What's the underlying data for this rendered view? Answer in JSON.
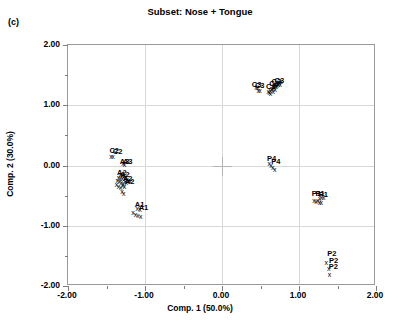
{
  "panel": {
    "label": "(c)"
  },
  "chart_data": {
    "type": "scatter",
    "title": "Subset: Nose + Tongue",
    "xlabel": "Comp. 1 (50.0%)",
    "ylabel": "Comp. 2 (30.0%)",
    "xlim": [
      -2.0,
      2.0
    ],
    "ylim": [
      -2.0,
      2.0
    ],
    "grid": true,
    "legend": "none",
    "marker_glyph": "x",
    "xticks": [
      {
        "value": -2.0,
        "label": "-2.00"
      },
      {
        "value": -1.0,
        "label": "-1.00"
      },
      {
        "value": 0.0,
        "label": "0.00"
      },
      {
        "value": 1.0,
        "label": "1.00"
      },
      {
        "value": 2.0,
        "label": "2.00"
      }
    ],
    "xticks_minor": [
      -1.5,
      -0.5,
      0.5,
      1.5
    ],
    "yticks": [
      {
        "value": 2.0,
        "label": "2.00"
      },
      {
        "value": 1.0,
        "label": "1.00"
      },
      {
        "value": 0.0,
        "label": "0.00"
      },
      {
        "value": -1.0,
        "label": "-1.00"
      },
      {
        "value": -2.0,
        "label": "-2.00"
      }
    ],
    "yticks_minor": [
      1.5,
      0.5,
      -0.5,
      -1.5
    ],
    "origin_marker": true,
    "groups": [
      {
        "name": "C3",
        "label_text": "C3",
        "points": [
          {
            "x": 0.44,
            "y": 1.3
          },
          {
            "x": 0.46,
            "y": 1.295
          },
          {
            "x": 0.47,
            "y": 1.26
          },
          {
            "x": 0.495,
            "y": 1.255
          },
          {
            "x": 0.6,
            "y": 1.23
          },
          {
            "x": 0.615,
            "y": 1.225
          },
          {
            "x": 0.625,
            "y": 1.255
          },
          {
            "x": 0.63,
            "y": 1.2
          },
          {
            "x": 0.645,
            "y": 1.265
          },
          {
            "x": 0.655,
            "y": 1.285
          },
          {
            "x": 0.66,
            "y": 1.32
          },
          {
            "x": 0.665,
            "y": 1.235
          },
          {
            "x": 0.675,
            "y": 1.3
          },
          {
            "x": 0.685,
            "y": 1.34
          },
          {
            "x": 0.69,
            "y": 1.275
          },
          {
            "x": 0.695,
            "y": 1.36
          },
          {
            "x": 0.705,
            "y": 1.315
          },
          {
            "x": 0.715,
            "y": 1.34
          },
          {
            "x": 0.725,
            "y": 1.375
          },
          {
            "x": 0.735,
            "y": 1.355
          },
          {
            "x": 0.745,
            "y": 1.38
          },
          {
            "x": 0.755,
            "y": 1.36
          },
          {
            "x": 0.765,
            "y": 1.395
          }
        ],
        "labels": [
          {
            "x": 0.45,
            "y": 1.33,
            "text": "C3"
          },
          {
            "x": 0.49,
            "y": 1.325,
            "text": "C3"
          },
          {
            "x": 0.635,
            "y": 1.31,
            "text": "C3"
          },
          {
            "x": 0.675,
            "y": 1.345,
            "text": "C3"
          },
          {
            "x": 0.705,
            "y": 1.38,
            "text": "C3"
          },
          {
            "x": 0.745,
            "y": 1.405,
            "text": "C3"
          }
        ]
      },
      {
        "name": "C2",
        "label_text": "C2",
        "points": [
          {
            "x": -1.44,
            "y": 0.155
          },
          {
            "x": -1.415,
            "y": 0.15
          }
        ],
        "labels": [
          {
            "x": -1.4,
            "y": 0.235,
            "text": "C2"
          },
          {
            "x": -1.355,
            "y": 0.23,
            "text": "C2"
          }
        ]
      },
      {
        "name": "A3",
        "label_text": "A3",
        "points": [
          {
            "x": -1.285,
            "y": 0.035
          },
          {
            "x": -1.265,
            "y": 0.02
          }
        ],
        "labels": [
          {
            "x": -1.265,
            "y": 0.065,
            "text": "A3"
          },
          {
            "x": -1.225,
            "y": 0.06,
            "text": "A3"
          }
        ]
      },
      {
        "name": "A2",
        "label_text": "A2",
        "points": [
          {
            "x": -1.32,
            "y": -0.14
          },
          {
            "x": -1.3,
            "y": -0.155
          },
          {
            "x": -1.345,
            "y": -0.185
          },
          {
            "x": -1.32,
            "y": -0.2
          },
          {
            "x": -1.295,
            "y": -0.21
          },
          {
            "x": -1.275,
            "y": -0.175
          },
          {
            "x": -1.255,
            "y": -0.195
          },
          {
            "x": -1.235,
            "y": -0.22
          },
          {
            "x": -1.36,
            "y": -0.245
          },
          {
            "x": -1.335,
            "y": -0.26
          },
          {
            "x": -1.31,
            "y": -0.27
          },
          {
            "x": -1.285,
            "y": -0.285
          },
          {
            "x": -1.26,
            "y": -0.255
          },
          {
            "x": -1.24,
            "y": -0.275
          },
          {
            "x": -1.215,
            "y": -0.245
          },
          {
            "x": -1.195,
            "y": -0.265
          },
          {
            "x": -1.37,
            "y": -0.315
          },
          {
            "x": -1.345,
            "y": -0.335
          },
          {
            "x": -1.315,
            "y": -0.36
          },
          {
            "x": -1.29,
            "y": -0.325
          },
          {
            "x": -1.265,
            "y": -0.345
          },
          {
            "x": -1.3,
            "y": -0.425
          },
          {
            "x": -1.275,
            "y": -0.455
          }
        ],
        "labels": [
          {
            "x": -1.3,
            "y": -0.12,
            "text": "A2"
          },
          {
            "x": -1.26,
            "y": -0.16,
            "text": "A2"
          },
          {
            "x": -1.225,
            "y": -0.23,
            "text": "A2"
          },
          {
            "x": -1.2,
            "y": -0.275,
            "text": "A2"
          }
        ]
      },
      {
        "name": "A1",
        "label_text": "A1",
        "points": [
          {
            "x": -1.155,
            "y": -0.78
          },
          {
            "x": -1.125,
            "y": -0.805
          },
          {
            "x": -1.09,
            "y": -0.825
          },
          {
            "x": -1.055,
            "y": -0.845
          },
          {
            "x": -1.1,
            "y": -0.705
          },
          {
            "x": -1.065,
            "y": -0.72
          }
        ],
        "labels": [
          {
            "x": -1.07,
            "y": -0.655,
            "text": "A1"
          },
          {
            "x": -1.02,
            "y": -0.7,
            "text": "A1"
          }
        ]
      },
      {
        "name": "P4",
        "label_text": "P4",
        "points": [
          {
            "x": 0.615,
            "y": 0.035
          },
          {
            "x": 0.635,
            "y": 0.01
          },
          {
            "x": 0.66,
            "y": -0.03
          },
          {
            "x": 0.685,
            "y": -0.055
          }
        ],
        "labels": [
          {
            "x": 0.645,
            "y": 0.115,
            "text": "P4"
          },
          {
            "x": 0.7,
            "y": 0.065,
            "text": "P4"
          }
        ]
      },
      {
        "name": "P1",
        "label_text": "P1",
        "points": [
          {
            "x": 1.195,
            "y": -0.565
          },
          {
            "x": 1.22,
            "y": -0.59
          },
          {
            "x": 1.245,
            "y": -0.575
          },
          {
            "x": 1.27,
            "y": -0.545
          },
          {
            "x": 1.295,
            "y": -0.525
          },
          {
            "x": 1.32,
            "y": -0.52
          },
          {
            "x": 1.265,
            "y": -0.61
          },
          {
            "x": 1.29,
            "y": -0.6
          }
        ],
        "labels": [
          {
            "x": 1.225,
            "y": -0.475,
            "text": "P1"
          },
          {
            "x": 1.275,
            "y": -0.47,
            "text": "P1"
          },
          {
            "x": 1.315,
            "y": -0.485,
            "text": "P1"
          }
        ]
      },
      {
        "name": "P2",
        "label_text": "P2",
        "points": [
          {
            "x": 1.355,
            "y": -1.595
          },
          {
            "x": 1.385,
            "y": -1.7
          },
          {
            "x": 1.395,
            "y": -1.805
          }
        ],
        "labels": [
          {
            "x": 1.425,
            "y": -1.47,
            "text": "P2"
          },
          {
            "x": 1.45,
            "y": -1.585,
            "text": "P2"
          },
          {
            "x": 1.445,
            "y": -1.685,
            "text": "P2"
          }
        ]
      }
    ]
  }
}
